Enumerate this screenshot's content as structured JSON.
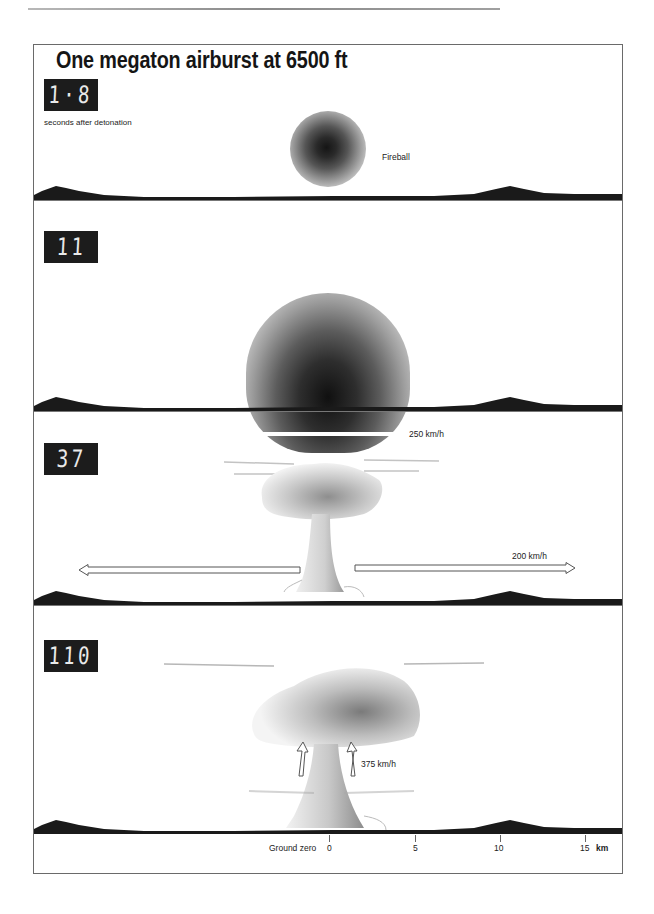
{
  "title": "One megaton airburst at 6500 ft",
  "panels": [
    {
      "time": "1·8",
      "caption": "seconds after detonation",
      "annotation": "Fireball",
      "stage": "fireball"
    },
    {
      "time": "11",
      "annotation": "250 km/h",
      "stage": "expanding fireball with blast wind"
    },
    {
      "time": "37",
      "annotation": "200 km/h",
      "stage": "mushroom cloud with outward winds"
    },
    {
      "time": "110",
      "annotation": "375 km/h",
      "stage": "mushroom cloud with inward/updraft winds"
    }
  ],
  "axis": {
    "origin_label": "Ground zero",
    "ticks": [
      "0",
      "5",
      "10",
      "15"
    ],
    "unit": "km"
  },
  "colors": {
    "ground": "#1a1a1a",
    "timer_bg": "#1c1c1c",
    "timer_digits": "#e9e9e9",
    "frame": "#6a6a6a"
  }
}
